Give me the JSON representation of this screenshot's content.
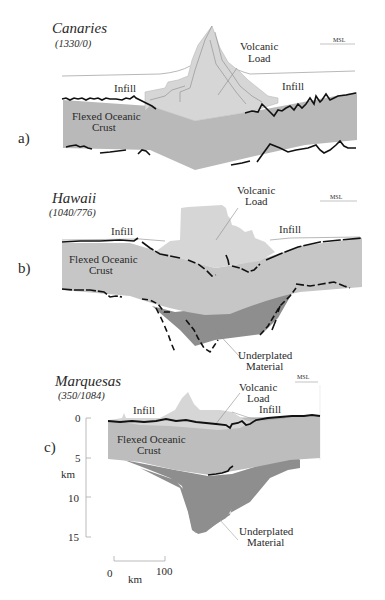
{
  "figure": {
    "panels": [
      {
        "id": "a",
        "panel_label": "a)",
        "title": "Canaries",
        "subtitle": "(1330/0)",
        "labels": {
          "volcanic_load_line1": "Volcanic",
          "volcanic_load_line2": "Load",
          "infill_left": "Infill",
          "infill_right": "Infill",
          "crust_line1": "Flexed Oceanic",
          "crust_line2": "Crust",
          "msl": "MSL"
        }
      },
      {
        "id": "b",
        "panel_label": "b)",
        "title": "Hawaii",
        "subtitle": "(1040/776)",
        "labels": {
          "volcanic_load_line1": "Volcanic",
          "volcanic_load_line2": "Load",
          "infill_left": "Infill",
          "infill_right": "Infill",
          "crust_line1": "Flexed Oceanic",
          "crust_line2": "Crust",
          "underplated_line1": "Underplated",
          "underplated_line2": "Material",
          "msl": "MSL"
        }
      },
      {
        "id": "c",
        "panel_label": "c)",
        "title": "Marquesas",
        "subtitle": "(350/1084)",
        "labels": {
          "volcanic_load_line1": "Volcanic",
          "volcanic_load_line2": "Load",
          "infill_left": "Infill",
          "infill_right": "Infill",
          "crust_line1": "Flexed Oceanic",
          "crust_line2": "Crust",
          "underplated_line1": "Underplated",
          "underplated_line2": "Material",
          "msl": "MSL"
        }
      }
    ],
    "depth_axis": {
      "unit": "km",
      "ticks": [
        "0",
        "5",
        "10",
        "15"
      ]
    },
    "scale_bar": {
      "start": "0",
      "end": "100",
      "unit": "km"
    },
    "colors": {
      "volcanic_load": "#d6d6d6",
      "crust_a": "#b9b9b9",
      "crust_b": "#c6c6c6",
      "crust_c": "#bdbdbd",
      "underplated": "#8e8e8e",
      "seismic_line": "#111111",
      "thin_line": "#9a9a9a"
    }
  }
}
